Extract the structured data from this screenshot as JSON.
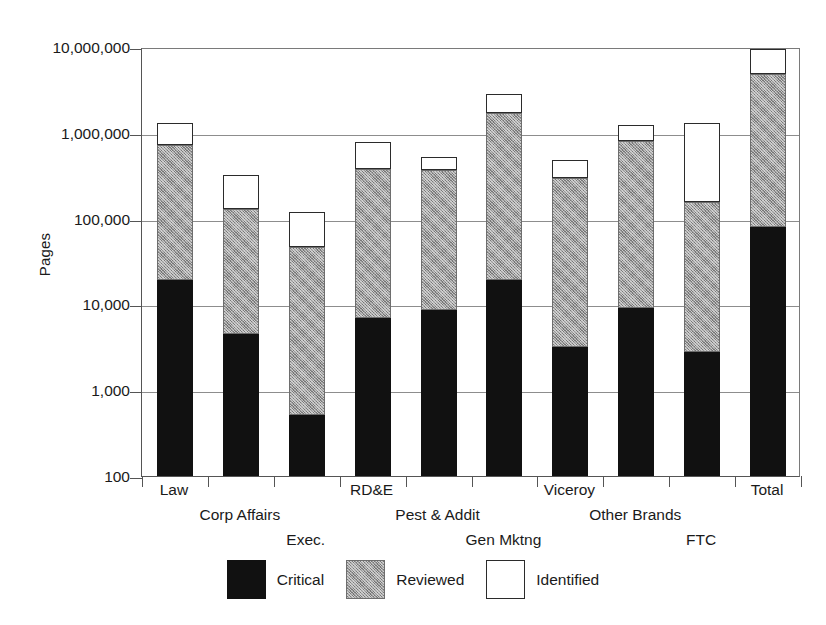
{
  "chart_data": {
    "type": "bar",
    "subtype": "stacked-vertical",
    "title": "",
    "xlabel": "",
    "ylabel": "Pages",
    "yscale": "log",
    "ylim": [
      100,
      10000000
    ],
    "ytick_labels": [
      "10,000,000",
      "1,000,000",
      "100,000",
      "10,000",
      "1,000",
      "100"
    ],
    "ytick_values": [
      10000000,
      1000000,
      100000,
      10000,
      1000,
      100
    ],
    "grid": "horizontal",
    "legend_position": "bottom-center",
    "stack_order": [
      "Critical",
      "Reviewed",
      "Identified"
    ],
    "categories": [
      "Law",
      "Corp Affairs",
      "Exec.",
      "RD&E",
      "Pest & Addit",
      "Gen Mktng",
      "Viceroy",
      "Other Brands",
      "FTC",
      "Total"
    ],
    "series": [
      {
        "name": "Critical",
        "color": "#111111",
        "cumulative_top": [
          19000,
          4500,
          520,
          7000,
          8500,
          19000,
          3200,
          9000,
          2800,
          80000
        ]
      },
      {
        "name": "Reviewed",
        "color": "#9a9a9a",
        "cumulative_top": [
          720000,
          130000,
          47000,
          380000,
          370000,
          1700000,
          300000,
          800000,
          155000,
          4800000
        ]
      },
      {
        "name": "Identified",
        "color": "#ffffff",
        "cumulative_top": [
          1300000,
          320000,
          120000,
          780000,
          520000,
          2800000,
          480000,
          1250000,
          1300000,
          9500000
        ]
      }
    ]
  },
  "legend": {
    "items": [
      {
        "label": "Critical",
        "swatch": "black-solid"
      },
      {
        "label": "Reviewed",
        "swatch": "gray-hatched"
      },
      {
        "label": "Identified",
        "swatch": "white-outline"
      }
    ]
  }
}
